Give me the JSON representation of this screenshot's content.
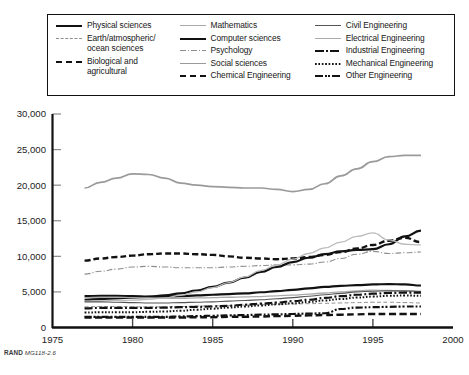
{
  "source_note": {
    "rand": "RAND",
    "code": "MG118-2.6"
  },
  "legend": {
    "columns": [
      {
        "items": [
          {
            "label": "Physical sciences",
            "style": "solid-thick",
            "color": "#121212"
          },
          {
            "label": "Earth/atmospheric/\nocean sciences",
            "style": "dash-thin",
            "color": "#8e8e8e"
          },
          {
            "label": "Biological and\nagricultural",
            "style": "dash-thick",
            "color": "#121212"
          }
        ]
      },
      {
        "items": [
          {
            "label": "Mathematics",
            "style": "solid-lt",
            "color": "#aaaaaa"
          },
          {
            "label": "Computer sciences",
            "style": "solid-thick",
            "color": "#121212"
          },
          {
            "label": "Psychology",
            "style": "dashdot-thin",
            "color": "#8e8e8e"
          },
          {
            "label": "Social sciences",
            "style": "solid-gray",
            "color": "#9a9a9a"
          },
          {
            "label": "Chemical Engineering",
            "style": "dash-med",
            "color": "#121212"
          }
        ]
      },
      {
        "items": [
          {
            "label": "Civil Engineering",
            "style": "solid-thin",
            "color": "#555555"
          },
          {
            "label": "Electrical Engineering",
            "style": "solid-lt",
            "color": "#bbbbbb"
          },
          {
            "label": "Industrial Engineering",
            "style": "dashdot-thick",
            "color": "#121212"
          },
          {
            "label": "Mechanical Engineering",
            "style": "dot",
            "color": "#121212"
          },
          {
            "label": "Other Engineering",
            "style": "dashdotdot",
            "color": "#121212"
          }
        ]
      }
    ]
  },
  "chart_data": {
    "type": "line",
    "title": "",
    "xlabel": "",
    "ylabel": "",
    "xlim": [
      1975,
      2000
    ],
    "ylim": [
      0,
      30000
    ],
    "xticks": [
      1975,
      1980,
      1985,
      1990,
      1995,
      2000
    ],
    "yticks": [
      0,
      5000,
      10000,
      15000,
      20000,
      25000,
      30000
    ],
    "ytick_labels": [
      "0",
      "5,000",
      "10,000",
      "15,000",
      "20,000",
      "25,000",
      "30,000"
    ],
    "grid": false,
    "legend_position": "above-plot",
    "x": [
      1977,
      1978,
      1979,
      1980,
      1981,
      1982,
      1983,
      1984,
      1985,
      1986,
      1987,
      1988,
      1989,
      1990,
      1991,
      1992,
      1993,
      1994,
      1995,
      1996,
      1997,
      1998
    ],
    "series": [
      {
        "name": "Social sciences",
        "style": "solid-gray",
        "color": "#9a9a9a",
        "values": [
          19600,
          20400,
          21000,
          21600,
          21500,
          21000,
          20300,
          20000,
          19800,
          19700,
          19600,
          19600,
          19400,
          19100,
          19400,
          20200,
          21300,
          22300,
          23300,
          24000,
          24200,
          24200
        ]
      },
      {
        "name": "Biological and agricultural",
        "style": "dash-thick",
        "color": "#121212",
        "values": [
          9400,
          9700,
          9900,
          10100,
          10300,
          10400,
          10400,
          10300,
          10200,
          10000,
          9800,
          9700,
          9600,
          9700,
          9900,
          10200,
          10600,
          11100,
          11600,
          12200,
          12600,
          12000
        ]
      },
      {
        "name": "Psychology",
        "style": "dashdot-thin",
        "color": "#8e8e8e",
        "values": [
          7500,
          7900,
          8200,
          8500,
          8600,
          8500,
          8400,
          8400,
          8400,
          8500,
          8600,
          8700,
          8800,
          8800,
          8900,
          9200,
          9700,
          10300,
          10700,
          10400,
          10500,
          10600
        ]
      },
      {
        "name": "Physical sciences",
        "style": "solid-thick",
        "color": "#121212",
        "values": [
          4400,
          4450,
          4450,
          4400,
          4350,
          4350,
          4400,
          4500,
          4600,
          4700,
          4800,
          4950,
          5100,
          5300,
          5500,
          5700,
          5850,
          5950,
          6050,
          6100,
          6050,
          5900
        ]
      },
      {
        "name": "Computer sciences",
        "style": "solid-thick",
        "color": "#121212",
        "values": [
          3900,
          4000,
          4100,
          4200,
          4300,
          4500,
          4800,
          5200,
          5700,
          6300,
          7000,
          7800,
          8500,
          9200,
          9800,
          10300,
          10700,
          10900,
          11000,
          11700,
          12800,
          13600
        ]
      },
      {
        "name": "Mathematics",
        "style": "solid-lt",
        "color": "#aaaaaa",
        "values": [
          4200,
          4250,
          4250,
          4200,
          4150,
          4100,
          4100,
          4150,
          4200,
          4250,
          4300,
          4350,
          4450,
          4550,
          4700,
          4850,
          5000,
          5150,
          5250,
          5200,
          5100,
          5050
        ]
      },
      {
        "name": "Electrical Engineering",
        "style": "solid-lt",
        "color": "#bbbbbb",
        "values": [
          3700,
          3750,
          3800,
          3850,
          3950,
          4150,
          4500,
          5000,
          5600,
          6300,
          7100,
          8000,
          8800,
          9600,
          10400,
          11200,
          12000,
          12800,
          13300,
          12300,
          11700,
          11600
        ]
      },
      {
        "name": "Civil Engineering",
        "style": "solid-thin",
        "color": "#555555",
        "values": [
          3600,
          3600,
          3550,
          3500,
          3450,
          3450,
          3500,
          3550,
          3600,
          3700,
          3800,
          3900,
          4050,
          4200,
          4400,
          4600,
          4800,
          5000,
          5100,
          5150,
          5150,
          5100
        ]
      },
      {
        "name": "Earth/atmospheric/ocean sciences",
        "style": "dash-thin",
        "color": "#8e8e8e",
        "values": [
          2900,
          2950,
          2950,
          2900,
          2900,
          2900,
          2950,
          3000,
          3050,
          3100,
          3150,
          3200,
          3250,
          3300,
          3350,
          3400,
          3450,
          3500,
          3550,
          3550,
          3500,
          3450
        ]
      },
      {
        "name": "Industrial Engineering",
        "style": "dashdot-thick",
        "color": "#121212",
        "values": [
          2700,
          2750,
          2750,
          2750,
          2750,
          2800,
          2850,
          2900,
          2950,
          3050,
          3200,
          3350,
          3500,
          3700,
          3900,
          4150,
          4400,
          4600,
          4750,
          4850,
          4900,
          4900
        ]
      },
      {
        "name": "Mechanical Engineering",
        "style": "dot",
        "color": "#121212",
        "values": [
          2100,
          2150,
          2150,
          2150,
          2200,
          2250,
          2350,
          2500,
          2650,
          2800,
          2950,
          3100,
          3250,
          3400,
          3600,
          3800,
          4000,
          4200,
          4350,
          4450,
          4500,
          4450
        ]
      },
      {
        "name": "Other Engineering",
        "style": "dashdotdot",
        "color": "#121212",
        "values": [
          1500,
          1500,
          1500,
          1500,
          1500,
          1500,
          1550,
          1600,
          1650,
          1700,
          1750,
          1800,
          1850,
          1900,
          1950,
          2000,
          2600,
          2800,
          2850,
          2900,
          2950,
          2950
        ]
      },
      {
        "name": "Chemical Engineering",
        "style": "dash-med",
        "color": "#121212",
        "values": [
          1400,
          1400,
          1400,
          1400,
          1400,
          1400,
          1400,
          1450,
          1450,
          1500,
          1500,
          1550,
          1600,
          1650,
          1700,
          1750,
          1800,
          1850,
          1900,
          1900,
          1900,
          1900
        ]
      }
    ]
  }
}
